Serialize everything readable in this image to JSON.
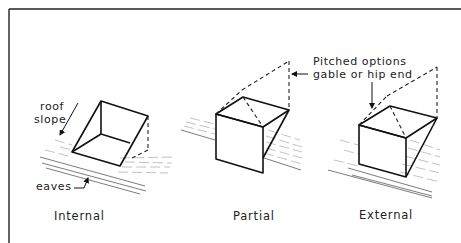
{
  "diagram": {
    "annotations": {
      "roof_slope_line1": "roof",
      "roof_slope_line2": "slope",
      "eaves": "eaves",
      "pitched_line1": "Pitched options",
      "pitched_line2": "gable or hip end"
    },
    "captions": {
      "internal": "Internal",
      "partial": "Partial",
      "external": "External"
    }
  }
}
